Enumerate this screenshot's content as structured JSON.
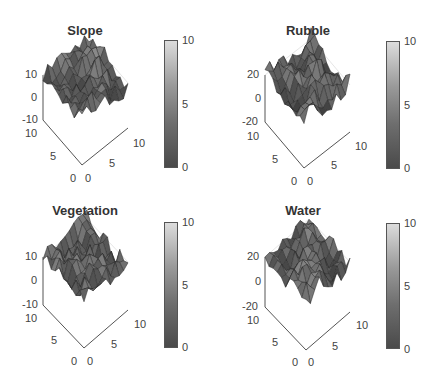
{
  "chart_data": [
    {
      "type": "surface",
      "title": "Slope",
      "x_ticks": [
        "0",
        "5",
        "10"
      ],
      "y_ticks": [
        "0",
        "5",
        "10"
      ],
      "z_ticks": [
        "-10",
        "0",
        "10"
      ],
      "zlim": [
        -10,
        10
      ],
      "colorbar": {
        "ticks": [
          "0",
          "5",
          "10"
        ],
        "range": [
          0,
          10
        ],
        "colormap": "gray"
      },
      "grid": true
    },
    {
      "type": "surface",
      "title": "Rubble",
      "x_ticks": [
        "0",
        "5",
        "10"
      ],
      "y_ticks": [
        "0",
        "5",
        "10"
      ],
      "z_ticks": [
        "-20",
        "0",
        "20"
      ],
      "zlim": [
        -20,
        20
      ],
      "colorbar": {
        "ticks": [
          "0",
          "5",
          "10"
        ],
        "range": [
          0,
          10
        ],
        "colormap": "gray"
      },
      "grid": true
    },
    {
      "type": "surface",
      "title": "Vegetation",
      "x_ticks": [
        "0",
        "5",
        "10"
      ],
      "y_ticks": [
        "0",
        "5",
        "10"
      ],
      "z_ticks": [
        "-10",
        "0",
        "10"
      ],
      "zlim": [
        -10,
        10
      ],
      "colorbar": {
        "ticks": [
          "0",
          "5",
          "10"
        ],
        "range": [
          0,
          10
        ],
        "colormap": "gray"
      },
      "grid": true
    },
    {
      "type": "surface",
      "title": "Water",
      "x_ticks": [
        "0",
        "5",
        "10"
      ],
      "y_ticks": [
        "0",
        "5",
        "10"
      ],
      "z_ticks": [
        "-20",
        "0",
        "20"
      ],
      "zlim": [
        -20,
        20
      ],
      "colorbar": {
        "ticks": [
          "0",
          "5",
          "10"
        ],
        "range": [
          0,
          10
        ],
        "colormap": "gray"
      },
      "grid": true
    }
  ],
  "panels": [
    {
      "title": "Slope",
      "z_top": "10",
      "z_mid": "0",
      "z_bot": "-10",
      "y_top": "10",
      "y_mid": "5",
      "y_zero": "0",
      "x_zero": "0",
      "x_mid": "5",
      "x_top": "10",
      "cb_top": "10",
      "cb_mid": "5",
      "cb_bot": "0"
    },
    {
      "title": "Rubble",
      "z_top": "20",
      "z_mid": "0",
      "z_bot": "-20",
      "y_top": "10",
      "y_mid": "5",
      "y_zero": "0",
      "x_zero": "0",
      "x_mid": "5",
      "x_top": "10",
      "cb_top": "10",
      "cb_mid": "5",
      "cb_bot": "0"
    },
    {
      "title": "Vegetation",
      "z_top": "10",
      "z_mid": "0",
      "z_bot": "-10",
      "y_top": "10",
      "y_mid": "5",
      "y_zero": "0",
      "x_zero": "0",
      "x_mid": "5",
      "x_top": "10",
      "cb_top": "10",
      "cb_mid": "5",
      "cb_bot": "0"
    },
    {
      "title": "Water",
      "z_top": "20",
      "z_mid": "0",
      "z_bot": "-20",
      "y_top": "10",
      "y_mid": "5",
      "y_zero": "0",
      "x_zero": "0",
      "x_mid": "5",
      "x_top": "10",
      "cb_top": "10",
      "cb_mid": "5",
      "cb_bot": "0"
    }
  ]
}
